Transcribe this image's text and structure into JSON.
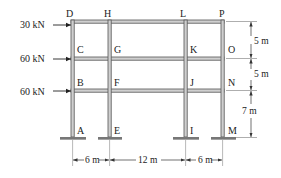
{
  "figure": {
    "type": "multi-story frame",
    "colors": {
      "member": "#555555",
      "member_fill": "#cfcfcf",
      "text": "#222222",
      "dim_line": "#444444"
    }
  },
  "nodes": {
    "D": "D",
    "H": "H",
    "L": "L",
    "P": "P",
    "C": "C",
    "G": "G",
    "K": "K",
    "O": "O",
    "B": "B",
    "F": "F",
    "J": "J",
    "N": "N",
    "A": "A",
    "E": "E",
    "I": "I",
    "M": "M"
  },
  "loads": [
    {
      "label": "30 kN",
      "node": "D"
    },
    {
      "label": "60 kN",
      "node": "C"
    },
    {
      "label": "60 kN",
      "node": "B"
    }
  ],
  "dimensions": {
    "horizontal": [
      "6 m",
      "12 m",
      "6 m"
    ],
    "vertical": [
      "5 m",
      "5 m",
      "7 m"
    ]
  }
}
